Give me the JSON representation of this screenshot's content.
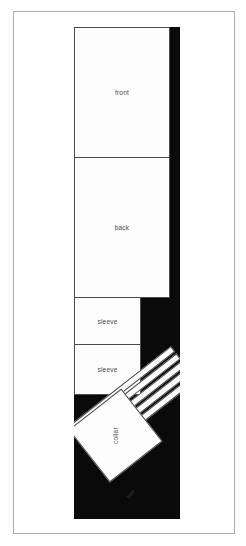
{
  "diagram": {
    "background_color": "#ffffff",
    "fabric_color": "#0a0a0a",
    "piece_color": "#fdfdfd",
    "outline_color": "#4a4a4a",
    "frame_color": "#adadad",
    "pieces": [
      {
        "id": "front",
        "label": "front"
      },
      {
        "id": "back",
        "label": "back"
      },
      {
        "id": "sleeve-1",
        "label": "sleeve"
      },
      {
        "id": "sleeve-2",
        "label": "sleeve"
      },
      {
        "id": "collar",
        "label": "collar"
      }
    ],
    "strips": {
      "label": "trim",
      "count": 5
    }
  }
}
